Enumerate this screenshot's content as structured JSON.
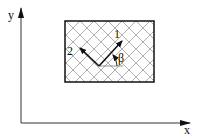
{
  "diagram": {
    "axes": {
      "x_label": "x",
      "y_label": "y"
    },
    "region": {
      "pattern": "cross-hatch",
      "border_color": "#111111",
      "hatch_color": "#9a9a9a"
    },
    "vectors": [
      {
        "label": "1",
        "direction": "up-right"
      },
      {
        "label": "2",
        "direction": "up-left"
      }
    ],
    "angle_label": "β"
  }
}
